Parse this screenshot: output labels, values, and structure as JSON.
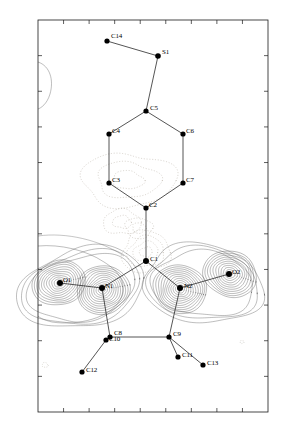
{
  "figure": {
    "kind": "crystallographic-deformation-density-map",
    "frame": {
      "x0": 38,
      "y0": 20,
      "x1": 268,
      "y1": 412,
      "stroke": "#1a1a1a",
      "stroke_width": 0.8,
      "ticks_top": 9,
      "ticks_bottom": 9,
      "ticks_left": 11,
      "ticks_right": 11,
      "tick_len": 4
    },
    "colors": {
      "positive_contour": "#4a4a4a",
      "negative_contour": "#b0a89c",
      "bond": "#2a2a2a",
      "atom": "#000000",
      "label": "#000000"
    }
  },
  "atoms": [
    {
      "id": "C14",
      "x": 107,
      "y": 41,
      "label": "C14",
      "lx": 111,
      "ly": 33,
      "r": 2.6
    },
    {
      "id": "S1",
      "x": 158,
      "y": 56,
      "label": "S1",
      "lx": 162,
      "ly": 49,
      "r": 2.8
    },
    {
      "id": "C5",
      "x": 146,
      "y": 111,
      "label": "C5",
      "lx": 150,
      "ly": 105,
      "r": 2.6
    },
    {
      "id": "C4",
      "x": 109,
      "y": 134,
      "label": "C4",
      "lx": 112,
      "ly": 128,
      "r": 2.6
    },
    {
      "id": "C6",
      "x": 183,
      "y": 134,
      "label": "C6",
      "lx": 186,
      "ly": 128,
      "r": 2.6
    },
    {
      "id": "C3",
      "x": 109,
      "y": 183,
      "label": "C3",
      "lx": 112,
      "ly": 177,
      "r": 2.6
    },
    {
      "id": "C7",
      "x": 183,
      "y": 183,
      "label": "C7",
      "lx": 186,
      "ly": 177,
      "r": 2.6
    },
    {
      "id": "C2",
      "x": 146,
      "y": 208,
      "label": "C2",
      "lx": 149,
      "ly": 202,
      "r": 2.6
    },
    {
      "id": "C1",
      "x": 146,
      "y": 261,
      "label": "C1",
      "lx": 150,
      "ly": 256,
      "r": 3.0
    },
    {
      "id": "O1",
      "x": 60,
      "y": 283,
      "label": "O1",
      "lx": 63,
      "ly": 277,
      "r": 3.0
    },
    {
      "id": "N1",
      "x": 102,
      "y": 288,
      "label": "N1",
      "lx": 105,
      "ly": 283,
      "r": 3.0
    },
    {
      "id": "N2",
      "x": 180,
      "y": 288,
      "label": "N2",
      "lx": 184,
      "ly": 283,
      "r": 3.0
    },
    {
      "id": "O2",
      "x": 229,
      "y": 274,
      "label": "O2",
      "lx": 232,
      "ly": 269,
      "r": 3.0
    },
    {
      "id": "C8",
      "x": 110,
      "y": 337,
      "label": "C8",
      "lx": 114,
      "ly": 330,
      "r": 2.6
    },
    {
      "id": "C10",
      "x": 106,
      "y": 340,
      "label": "C10",
      "lx": 109,
      "ly": 336,
      "r": 2.6
    },
    {
      "id": "C9",
      "x": 169,
      "y": 337,
      "label": "C9",
      "lx": 173,
      "ly": 331,
      "r": 2.6
    },
    {
      "id": "C11",
      "x": 178,
      "y": 357,
      "label": "C11",
      "lx": 182,
      "ly": 352,
      "r": 2.6
    },
    {
      "id": "C12",
      "x": 82,
      "y": 372,
      "label": "C12",
      "lx": 86,
      "ly": 367,
      "r": 2.6
    },
    {
      "id": "C13",
      "x": 203,
      "y": 365,
      "label": "C13",
      "lx": 207,
      "ly": 360,
      "r": 2.6
    }
  ],
  "bonds": [
    [
      "C14",
      "S1"
    ],
    [
      "S1",
      "C5"
    ],
    [
      "C5",
      "C4"
    ],
    [
      "C4",
      "C3"
    ],
    [
      "C3",
      "C2"
    ],
    [
      "C2",
      "C7"
    ],
    [
      "C7",
      "C6"
    ],
    [
      "C6",
      "C5"
    ],
    [
      "C2",
      "C1"
    ],
    [
      "C1",
      "N1"
    ],
    [
      "C1",
      "N2"
    ],
    [
      "N1",
      "O1"
    ],
    [
      "N2",
      "O2"
    ],
    [
      "N1",
      "C8"
    ],
    [
      "N2",
      "C9"
    ],
    [
      "C8",
      "C9"
    ],
    [
      "C10",
      "C12"
    ],
    [
      "C9",
      "C11"
    ],
    [
      "C9",
      "C13"
    ]
  ],
  "density_peaks": [
    {
      "name": "O1-lone-pair",
      "cx": 59,
      "cy": 283,
      "rx": 27,
      "ry": 22,
      "rot": -14,
      "levels": 11,
      "sign": "positive"
    },
    {
      "name": "N1-bonding",
      "cx": 103,
      "cy": 290,
      "rx": 27,
      "ry": 24,
      "rot": -12,
      "levels": 12,
      "sign": "positive"
    },
    {
      "name": "N2-bonding",
      "cx": 180,
      "cy": 289,
      "rx": 27,
      "ry": 24,
      "rot": 12,
      "levels": 12,
      "sign": "positive"
    },
    {
      "name": "O2-lone-pair",
      "cx": 230,
      "cy": 274,
      "rx": 27,
      "ry": 23,
      "rot": 16,
      "levels": 11,
      "sign": "positive"
    }
  ],
  "negative_regions": [
    {
      "name": "ring-interior-negative",
      "cx": 128,
      "cy": 180,
      "rx": 45,
      "ry": 28,
      "levels": 3
    },
    {
      "name": "c1-negative",
      "cx": 146,
      "cy": 252,
      "rx": 25,
      "ry": 20,
      "levels": 4
    },
    {
      "name": "c2-negative",
      "cx": 139,
      "cy": 228,
      "rx": 14,
      "ry": 10,
      "levels": 2
    },
    {
      "name": "top-negative-lobe",
      "cx": 122,
      "cy": 222,
      "rx": 18,
      "ry": 13,
      "levels": 2
    }
  ],
  "minor_marks": [
    {
      "name": "bottom-left-speck",
      "cx": 45,
      "cy": 365,
      "r": 3
    },
    {
      "name": "right-speck",
      "cx": 242,
      "cy": 342,
      "r": 2
    }
  ]
}
